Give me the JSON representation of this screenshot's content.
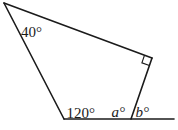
{
  "figure": {
    "background_color": "#ffffff",
    "stroke_color": "#1b1b1b",
    "vertices": {
      "A": [
        4,
        3
      ],
      "B": [
        152,
        58
      ],
      "C": [
        131,
        119
      ],
      "D": [
        64,
        119
      ],
      "E": [
        174,
        119
      ]
    },
    "edges": [
      {
        "name": "edge-top",
        "from": "A",
        "to": "B"
      },
      {
        "name": "edge-right",
        "from": "B",
        "to": "C"
      },
      {
        "name": "edge-left",
        "from": "A",
        "to": "D"
      },
      {
        "name": "base-line",
        "from": "D",
        "to": "E"
      }
    ],
    "right_angle_marker": {
      "at_vertex": "B",
      "points": [
        [
          144.5,
          55.2
        ],
        [
          141.9,
          62.8
        ],
        [
          149.4,
          65.6
        ]
      ]
    },
    "labels": [
      {
        "text": "40°",
        "x": 21,
        "y": 36.5,
        "italic": false,
        "meaning": "angle at top-left vertex"
      },
      {
        "text": "120°",
        "x": 66.5,
        "y": 117.5,
        "italic": false,
        "meaning": "angle at bottom-left vertex"
      },
      {
        "text": "a°",
        "x": 111.5,
        "y": 117,
        "italic": true,
        "meaning": "interior angle at base vertex"
      },
      {
        "text": "b°",
        "x": 135.5,
        "y": 117,
        "italic": true,
        "meaning": "exterior angle on base ray"
      }
    ]
  }
}
